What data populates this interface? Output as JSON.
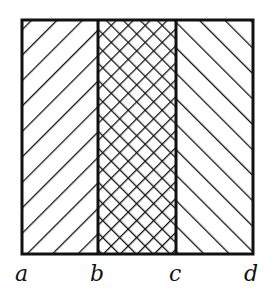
{
  "diagram": {
    "regions": [
      {
        "id": "left",
        "from": "a",
        "to": "b",
        "pattern": "forward-diagonal-hatch"
      },
      {
        "id": "middle",
        "from": "b",
        "to": "c",
        "pattern": "cross-hatch"
      },
      {
        "id": "right",
        "from": "c",
        "to": "d",
        "pattern": "backward-diagonal-hatch"
      }
    ],
    "labels": [
      "a",
      "b",
      "c",
      "d"
    ],
    "stroke_color": "#111111",
    "background": "#ffffff"
  }
}
